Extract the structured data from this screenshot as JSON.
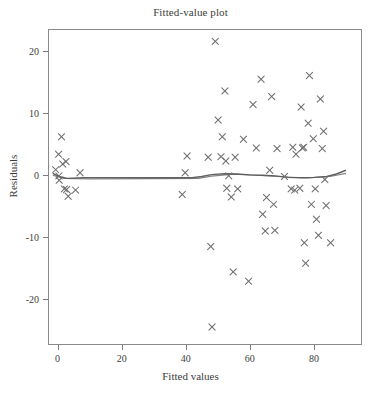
{
  "chart_data": {
    "type": "scatter",
    "title": "Fitted-value plot",
    "xlabel": "Fitted values",
    "ylabel": "Residuals",
    "xlim": [
      -3,
      95
    ],
    "ylim": [
      -27.5,
      23.5
    ],
    "xticks": [
      0,
      20,
      40,
      60,
      80
    ],
    "yticks": [
      20,
      10,
      0,
      -10,
      -20
    ],
    "xtick_labels": [
      "0",
      "20",
      "40",
      "60",
      "80"
    ],
    "ytick_labels": [
      "20",
      "10",
      "0",
      "-10",
      "-20"
    ],
    "grid": false,
    "legend": null,
    "marker": "x",
    "marker_color": "#6e6e6e",
    "frame_color": "#8a8a8a",
    "text_color": "#3d3d3d",
    "series": [
      {
        "name": "Residuals",
        "points": [
          [
            -0.6,
            0.8
          ],
          [
            0.3,
            3.3
          ],
          [
            0.4,
            -0.2
          ],
          [
            0.5,
            -0.9
          ],
          [
            1.2,
            6.1
          ],
          [
            1.6,
            1.7
          ],
          [
            2.1,
            -2.3
          ],
          [
            2.6,
            2.1
          ],
          [
            2.8,
            -2.4
          ],
          [
            3.3,
            -3.5
          ],
          [
            5.6,
            -2.5
          ],
          [
            7.0,
            0.3
          ],
          [
            38.9,
            -3.2
          ],
          [
            39.8,
            0.3
          ],
          [
            40.4,
            3.0
          ],
          [
            47.0,
            2.8
          ],
          [
            47.8,
            -11.6
          ],
          [
            48.2,
            -24.6
          ],
          [
            49.2,
            21.5
          ],
          [
            50.1,
            8.8
          ],
          [
            51.0,
            2.9
          ],
          [
            51.4,
            6.1
          ],
          [
            52.2,
            13.5
          ],
          [
            52.5,
            2.2
          ],
          [
            52.8,
            -2.2
          ],
          [
            53.4,
            -0.2
          ],
          [
            54.2,
            -3.6
          ],
          [
            54.8,
            -15.7
          ],
          [
            55.4,
            2.8
          ],
          [
            56.2,
            -2.3
          ],
          [
            58.0,
            5.7
          ],
          [
            59.6,
            -17.2
          ],
          [
            61.0,
            11.3
          ],
          [
            62.0,
            4.3
          ],
          [
            63.5,
            15.4
          ],
          [
            64.0,
            -6.4
          ],
          [
            64.8,
            -9.1
          ],
          [
            65.2,
            -3.7
          ],
          [
            66.2,
            0.7
          ],
          [
            66.8,
            12.6
          ],
          [
            67.4,
            -4.8
          ],
          [
            67.8,
            -9.0
          ],
          [
            68.5,
            4.2
          ],
          [
            70.8,
            -0.3
          ],
          [
            72.9,
            -2.3
          ],
          [
            73.4,
            4.4
          ],
          [
            74.0,
            -2.5
          ],
          [
            74.4,
            3.3
          ],
          [
            75.6,
            -2.2
          ],
          [
            76.0,
            10.9
          ],
          [
            76.4,
            4.3
          ],
          [
            76.8,
            4.4
          ],
          [
            77.0,
            -11.0
          ],
          [
            77.4,
            -14.3
          ],
          [
            78.2,
            8.3
          ],
          [
            78.6,
            16.0
          ],
          [
            79.2,
            -4.8
          ],
          [
            79.8,
            5.8
          ],
          [
            80.4,
            -2.3
          ],
          [
            80.8,
            -7.2
          ],
          [
            81.4,
            -9.8
          ],
          [
            82.0,
            12.2
          ],
          [
            82.6,
            4.2
          ],
          [
            83.0,
            7.0
          ],
          [
            83.4,
            -0.8
          ],
          [
            83.8,
            -5.0
          ],
          [
            85.2,
            -11.0
          ]
        ]
      }
    ],
    "smoother": {
      "name": "lowess-line",
      "color": "#5a5a5a",
      "points": [
        [
          -1.5,
          0.2
        ],
        [
          0.5,
          -0.3
        ],
        [
          3.0,
          -0.6
        ],
        [
          8.0,
          -0.5
        ],
        [
          15.0,
          -0.5
        ],
        [
          25.0,
          -0.5
        ],
        [
          35.0,
          -0.5
        ],
        [
          42.0,
          -0.5
        ],
        [
          45.0,
          -0.3
        ],
        [
          48.0,
          0.0
        ],
        [
          52.0,
          0.15
        ],
        [
          56.0,
          0.1
        ],
        [
          60.0,
          -0.05
        ],
        [
          64.0,
          -0.1
        ],
        [
          68.0,
          -0.2
        ],
        [
          72.0,
          -0.45
        ],
        [
          76.0,
          -0.5
        ],
        [
          80.0,
          -0.45
        ],
        [
          84.0,
          -0.3
        ],
        [
          87.0,
          0.1
        ],
        [
          90.0,
          0.7
        ]
      ],
      "second_points": [
        [
          -1.5,
          -0.1
        ],
        [
          2.0,
          -0.6
        ],
        [
          10.0,
          -0.7
        ],
        [
          30.0,
          -0.65
        ],
        [
          44.0,
          -0.6
        ],
        [
          48.0,
          -0.25
        ],
        [
          55.0,
          0.05
        ],
        [
          62.0,
          -0.1
        ],
        [
          70.0,
          -0.35
        ],
        [
          78.0,
          -0.55
        ],
        [
          85.0,
          -0.3
        ],
        [
          90.0,
          0.2
        ]
      ]
    }
  }
}
